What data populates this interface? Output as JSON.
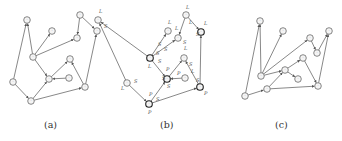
{
  "captions": {
    "a": "(a)",
    "b": "(b)",
    "c": "(c)"
  },
  "colors": {
    "stroke": "#555555",
    "node_fill": "#f4f4f4",
    "text": "#333333"
  },
  "panels": [
    {
      "id": "a",
      "offset_x": 0,
      "nodes": [
        {
          "id": "n1",
          "x": 27,
          "y": 20
        },
        {
          "id": "n2",
          "x": 52,
          "y": 31
        },
        {
          "id": "n3",
          "x": 33,
          "y": 57
        },
        {
          "id": "n4",
          "x": 80,
          "y": 15
        },
        {
          "id": "n5",
          "x": 97,
          "y": 31
        },
        {
          "id": "n6",
          "x": 77,
          "y": 38
        },
        {
          "id": "n7",
          "x": 70,
          "y": 59
        },
        {
          "id": "n8",
          "x": 49,
          "y": 79
        },
        {
          "id": "n9",
          "x": 69,
          "y": 78
        },
        {
          "id": "n10",
          "x": 13,
          "y": 82
        },
        {
          "id": "n11",
          "x": 31,
          "y": 101
        },
        {
          "id": "n12",
          "x": 85,
          "y": 87
        }
      ],
      "edges": [
        [
          "n10",
          "n1"
        ],
        [
          "n3",
          "n1"
        ],
        [
          "n3",
          "n2"
        ],
        [
          "n3",
          "n6"
        ],
        [
          "n4",
          "n6"
        ],
        [
          "n4",
          "n5"
        ],
        [
          "n3",
          "n8"
        ],
        [
          "n8",
          "n7"
        ],
        [
          "n9",
          "n8"
        ],
        [
          "n12",
          "n7"
        ],
        [
          "n12",
          "n5"
        ],
        [
          "n10",
          "n11"
        ],
        [
          "n11",
          "n8"
        ],
        [
          "n11",
          "n12"
        ]
      ],
      "edge_labels": []
    },
    {
      "id": "b",
      "offset_x": 112,
      "bold_nodes": [
        "n3",
        "n8",
        "n11",
        "n12",
        "n5"
      ],
      "nodes": [
        {
          "id": "n1",
          "x": -12,
          "y": 20
        },
        {
          "id": "n2",
          "x": 56,
          "y": 31
        },
        {
          "id": "n3",
          "x": 38,
          "y": 58
        },
        {
          "id": "n4",
          "x": 74,
          "y": 15
        },
        {
          "id": "n5",
          "x": 89,
          "y": 32
        },
        {
          "id": "n6",
          "x": 66,
          "y": 38
        },
        {
          "id": "n7",
          "x": 72,
          "y": 58
        },
        {
          "id": "n8",
          "x": 55,
          "y": 79
        },
        {
          "id": "n9",
          "x": 73,
          "y": 78
        },
        {
          "id": "n10",
          "x": 15,
          "y": 83
        },
        {
          "id": "n11",
          "x": 37,
          "y": 104
        },
        {
          "id": "n12",
          "x": 88,
          "y": 87
        }
      ],
      "edges": [
        [
          "n10",
          "n1"
        ],
        [
          "n3",
          "n1"
        ],
        [
          "n3",
          "n2"
        ],
        [
          "n3",
          "n6"
        ],
        [
          "n4",
          "n6"
        ],
        [
          "n4",
          "n5"
        ],
        [
          "n3",
          "n8"
        ],
        [
          "n8",
          "n7"
        ],
        [
          "n9",
          "n8"
        ],
        [
          "n12",
          "n7"
        ],
        [
          "n12",
          "n5"
        ],
        [
          "n10",
          "n11"
        ],
        [
          "n11",
          "n8"
        ],
        [
          "n11",
          "n12"
        ]
      ],
      "edge_labels": [
        {
          "text": "L",
          "x": -13,
          "y": 13
        },
        {
          "text": "S",
          "x": -8,
          "y": 28
        },
        {
          "text": "S",
          "x": 46,
          "y": 46
        },
        {
          "text": "S",
          "x": 52,
          "y": 51
        },
        {
          "text": "S",
          "x": 44,
          "y": 55
        },
        {
          "text": "L",
          "x": 36,
          "y": 68
        },
        {
          "text": "S",
          "x": 46,
          "y": 63
        },
        {
          "text": "L",
          "x": 56,
          "y": 24
        },
        {
          "text": "L",
          "x": 74,
          "y": 9
        },
        {
          "text": "L",
          "x": 77,
          "y": 24
        },
        {
          "text": "L",
          "x": 63,
          "y": 30
        },
        {
          "text": "S",
          "x": 71,
          "y": 44
        },
        {
          "text": "L",
          "x": 92,
          "y": 25
        },
        {
          "text": "S",
          "x": 84,
          "y": 36
        },
        {
          "text": "L",
          "x": 72,
          "y": 50
        },
        {
          "text": "S",
          "x": 77,
          "y": 66
        },
        {
          "text": "P",
          "x": 54,
          "y": 71
        },
        {
          "text": "S",
          "x": 50,
          "y": 80
        },
        {
          "text": "S",
          "x": 55,
          "y": 88
        },
        {
          "text": "P",
          "x": 65,
          "y": 75
        },
        {
          "text": "L",
          "x": 79,
          "y": 73
        },
        {
          "text": "S",
          "x": 84,
          "y": 82
        },
        {
          "text": "P",
          "x": 92,
          "y": 95
        },
        {
          "text": "S",
          "x": 22,
          "y": 83
        },
        {
          "text": "L",
          "x": 9,
          "y": 90
        },
        {
          "text": "P",
          "x": 37,
          "y": 96
        },
        {
          "text": "P",
          "x": 36,
          "y": 114
        },
        {
          "text": "S",
          "x": 44,
          "y": 101
        }
      ]
    },
    {
      "id": "c",
      "offset_x": 230,
      "nodes": [
        {
          "id": "n1",
          "x": 30,
          "y": 21
        },
        {
          "id": "n2",
          "x": 53,
          "y": 31
        },
        {
          "id": "n3",
          "x": 31,
          "y": 76
        },
        {
          "id": "n4",
          "x": 80,
          "y": 38
        },
        {
          "id": "n5",
          "x": 99,
          "y": 31
        },
        {
          "id": "n6",
          "x": 73,
          "y": 58
        },
        {
          "id": "n7",
          "x": 55,
          "y": 70
        },
        {
          "id": "n8",
          "x": 68,
          "y": 79
        },
        {
          "id": "n9",
          "x": 37,
          "y": 89
        },
        {
          "id": "n10",
          "x": 15,
          "y": 96
        },
        {
          "id": "n11",
          "x": 87,
          "y": 53
        },
        {
          "id": "n12",
          "x": 88,
          "y": 86
        }
      ],
      "edges": [
        [
          "n10",
          "n1"
        ],
        [
          "n3",
          "n1"
        ],
        [
          "n3",
          "n2"
        ],
        [
          "n3",
          "n4"
        ],
        [
          "n4",
          "n11"
        ],
        [
          "n11",
          "n5"
        ],
        [
          "n3",
          "n7"
        ],
        [
          "n7",
          "n6"
        ],
        [
          "n7",
          "n8"
        ],
        [
          "n6",
          "n12"
        ],
        [
          "n12",
          "n5"
        ],
        [
          "n10",
          "n9"
        ],
        [
          "n9",
          "n7"
        ],
        [
          "n9",
          "n12"
        ]
      ],
      "edge_labels": []
    }
  ]
}
